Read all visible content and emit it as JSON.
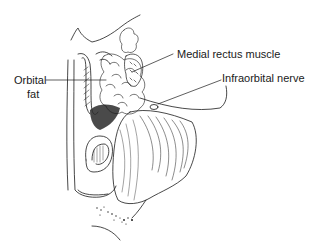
{
  "figure": {
    "labels": [
      {
        "id": "medial-rectus",
        "text": "Medial rectus muscle"
      },
      {
        "id": "infraorbital-nerve",
        "text": "Infraorbital nerve"
      },
      {
        "id": "orbital-fat-line1",
        "text": "Orbital"
      },
      {
        "id": "orbital-fat-line2",
        "text": "fat"
      }
    ],
    "colors": {
      "ink": "#1a1a1a",
      "background": "#ffffff"
    }
  }
}
